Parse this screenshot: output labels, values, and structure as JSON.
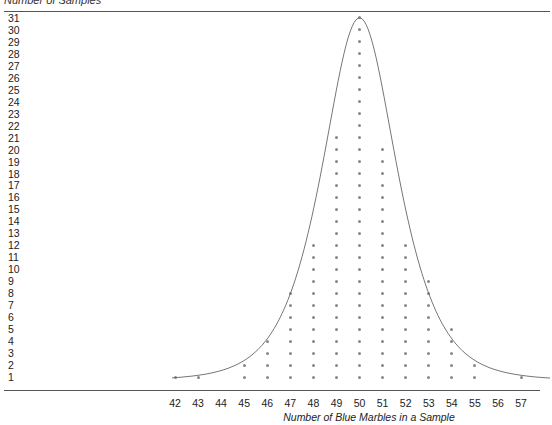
{
  "chart_data": {
    "type": "scatter",
    "subtype": "dot_plot",
    "title": "",
    "top_label": "Number of Samples",
    "xlabel": "Number of Blue Marbles in a Sample",
    "ylabel": "Number of Samples",
    "categories": [
      42,
      43,
      44,
      45,
      46,
      47,
      48,
      49,
      50,
      51,
      52,
      53,
      54,
      55,
      56,
      57
    ],
    "values": [
      1,
      1,
      0,
      2,
      4,
      8,
      12,
      21,
      31,
      20,
      12,
      9,
      5,
      2,
      0,
      1
    ],
    "y_ticks": [
      1,
      2,
      3,
      4,
      5,
      6,
      7,
      8,
      9,
      10,
      11,
      12,
      13,
      14,
      15,
      16,
      17,
      18,
      19,
      20,
      21,
      22,
      23,
      24,
      25,
      26,
      27,
      28,
      29,
      30,
      31
    ],
    "ylim": [
      1,
      31
    ],
    "xlim": [
      42,
      57
    ],
    "overlay": "normal-like curve centered at 50",
    "grid": false,
    "legend": "none"
  },
  "colors": {
    "dot": "#888888",
    "curve": "#666666",
    "axis": "#555555"
  }
}
